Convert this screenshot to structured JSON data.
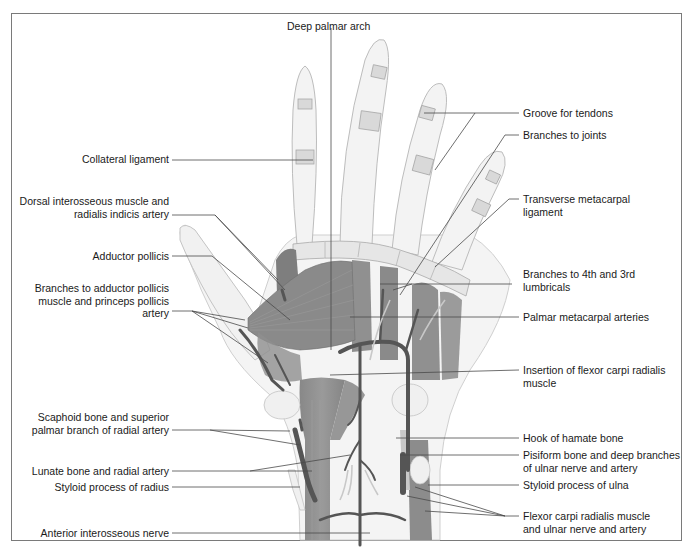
{
  "figure": {
    "colors": {
      "muscle": "#8c8c8c",
      "muscle_dark": "#6e6e6e",
      "artery": "#555555",
      "bone_fill": "#f2f2f2",
      "bone_outline": "#b8b8b8",
      "skin_outline": "#c8c8c8",
      "leader_line": "#4a4a4a",
      "frame": "#7a7a7a"
    }
  },
  "labels": {
    "top": {
      "deep_palmar_arch": "Deep palmar arch"
    },
    "left": [
      {
        "id": "collateral_ligament",
        "text": "Collateral ligament"
      },
      {
        "id": "dorsal_interosseous",
        "text": "Dorsal interosseous muscle and\nradialis indicis artery"
      },
      {
        "id": "adductor_pollicis",
        "text": "Adductor pollicis"
      },
      {
        "id": "branches_adductor",
        "text": "Branches to adductor pollicis\nmuscle and princeps pollicis\nartery"
      },
      {
        "id": "scaphoid",
        "text": "Scaphoid bone and superior\npalmar branch of radial artery"
      },
      {
        "id": "lunate",
        "text": "Lunate bone and radial artery"
      },
      {
        "id": "styloid_radius",
        "text": "Styloid process of radius"
      },
      {
        "id": "anterior_interosseous",
        "text": "Anterior interosseous nerve"
      }
    ],
    "right": [
      {
        "id": "groove_tendons",
        "text": "Groove for tendons"
      },
      {
        "id": "branches_joints",
        "text": "Branches to joints"
      },
      {
        "id": "transverse_metacarpal",
        "text": "Transverse metacarpal\nligament"
      },
      {
        "id": "branches_lumbricals",
        "text": "Branches to 4th and 3rd\nlumbricals"
      },
      {
        "id": "palmar_metacarpal",
        "text": "Palmar metacarpal arteries"
      },
      {
        "id": "insertion_fcr",
        "text": "Insertion of flexor carpi radialis\nmuscle"
      },
      {
        "id": "hook_hamate",
        "text": "Hook of hamate bone"
      },
      {
        "id": "pisiform",
        "text": "Pisiform bone and deep branches\nof ulnar nerve and artery"
      },
      {
        "id": "styloid_ulna",
        "text": "Styloid process of ulna"
      },
      {
        "id": "fcr_ulnar",
        "text": "Flexor carpi radialis muscle\nand ulnar nerve and artery"
      }
    ]
  }
}
